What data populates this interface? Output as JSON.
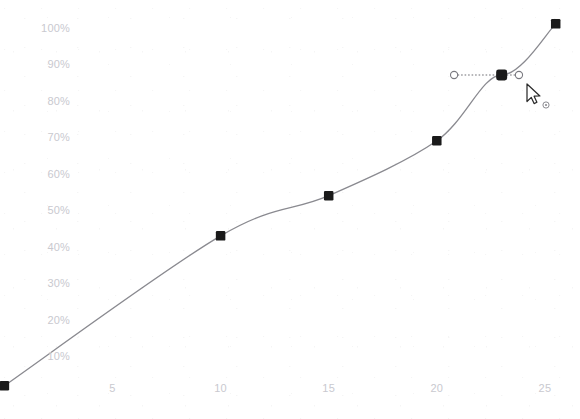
{
  "app": {
    "title": "Curve Editor",
    "background_color": "#ffffff"
  },
  "chart_data": {
    "type": "line",
    "title": "",
    "subtitle": "",
    "xlabel": "",
    "ylabel": "",
    "grid": false,
    "legend": "none",
    "interpolation": "smooth-spline",
    "line_color": "#8a8a90",
    "marker_color": "#1a1a1a",
    "marker_shape": "square",
    "xlim": [
      0,
      26
    ],
    "ylim": [
      0,
      105
    ],
    "x_ticks": [
      5,
      10,
      15,
      20,
      25
    ],
    "x_tick_labels": [
      "5",
      "10",
      "15",
      "20",
      "25"
    ],
    "y_ticks": [
      10,
      20,
      30,
      40,
      50,
      60,
      70,
      80,
      90,
      100
    ],
    "y_tick_labels": [
      "10%",
      "20%",
      "30%",
      "40%",
      "50%",
      "60%",
      "70%",
      "80%",
      "90%",
      "100%"
    ],
    "series": [
      {
        "name": "curve",
        "x": [
          0,
          10,
          15,
          20,
          23,
          25.5
        ],
        "y": [
          2,
          43,
          54,
          69,
          87,
          101
        ],
        "values": [
          2,
          43,
          54,
          69,
          87,
          101
        ]
      }
    ],
    "points": [
      {
        "index": 0,
        "x": 0,
        "y": 2,
        "label": "2%",
        "selected": false
      },
      {
        "index": 1,
        "x": 10,
        "y": 43,
        "label": "43%",
        "selected": false
      },
      {
        "index": 2,
        "x": 15,
        "y": 54,
        "label": "54%",
        "selected": false
      },
      {
        "index": 3,
        "x": 20,
        "y": 69,
        "label": "69%",
        "selected": false
      },
      {
        "index": 4,
        "x": 23,
        "y": 87,
        "label": "87%",
        "selected": true
      },
      {
        "index": 5,
        "x": 25.5,
        "y": 101,
        "label": "101%",
        "selected": false
      }
    ]
  },
  "selection": {
    "point_index": 4,
    "tangent_handles": {
      "left": {
        "x": 20.8,
        "y": 87,
        "style": "open-circle"
      },
      "right": {
        "x": 23.8,
        "y": 87,
        "style": "open-circle"
      },
      "line_style": "dotted",
      "line_color": "#6e6e74"
    }
  },
  "cursor": {
    "icon": "arrow-pointer",
    "x": 527,
    "y": 84,
    "badge_icon": "move-dot"
  },
  "colors": {
    "axis_text": "#c9c9cf",
    "curve": "#8a8a90",
    "marker": "#1a1a1a",
    "handle_stroke": "#6e6e74",
    "handle_fill": "#ffffff"
  }
}
